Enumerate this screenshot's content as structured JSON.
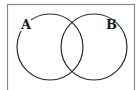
{
  "diagram": {
    "type": "venn",
    "universal_set": {
      "x": 7,
      "y": 4,
      "width": 127,
      "height": 86,
      "stroke": "#8a8a8a"
    },
    "sets": [
      {
        "label": "A",
        "cx": 50,
        "cy": 47,
        "r": 33,
        "label_x": 25,
        "label_y": 29
      },
      {
        "label": "B",
        "cx": 94,
        "cy": 47,
        "r": 33,
        "label_x": 110,
        "label_y": 29
      }
    ],
    "stroke_color": "#2b2b2b"
  }
}
